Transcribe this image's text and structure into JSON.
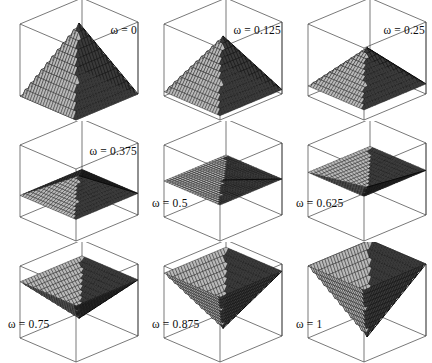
{
  "figure": {
    "type": "panel-grid",
    "rows": 3,
    "columns": 3,
    "background": "#ffffff",
    "line_color": "#3f3f3f",
    "mesh_line_color": "#111111",
    "face_light_color": "#b9b9b9",
    "face_dark_color": "#3a3a3a"
  },
  "chart_data": {
    "type": "line",
    "title": "",
    "subtitle": "",
    "xlabel": "",
    "ylabel": "",
    "zlabel": "",
    "grid": false,
    "legend_position": "none",
    "parameter_symbol": "ω",
    "parameter_values": [
      0,
      0.125,
      0.25,
      0.375,
      0.5,
      0.625,
      0.75,
      0.875,
      1
    ],
    "apex_height_fraction": [
      1,
      0.82,
      0.66,
      0.56,
      0.5,
      0.4,
      0.26,
      0.12,
      0.0
    ],
    "base_height_fraction": [
      0.0,
      0.06,
      0.14,
      0.3,
      0.5,
      0.62,
      0.78,
      0.9,
      1.0
    ],
    "axis_ranges": {
      "x": [
        0,
        1
      ],
      "y": [
        0,
        1
      ],
      "z": [
        0,
        1
      ]
    },
    "panels": [
      {
        "index": 0,
        "label": "ω = 0",
        "omega": 0,
        "label_position": "top-right",
        "apex": 1.0,
        "base": 0.0
      },
      {
        "index": 1,
        "label": "ω = 0.125",
        "omega": 0.125,
        "label_position": "top-right",
        "apex": 0.82,
        "base": 0.06
      },
      {
        "index": 2,
        "label": "ω = 0.25",
        "omega": 0.25,
        "label_position": "top-right",
        "apex": 0.66,
        "base": 0.14
      },
      {
        "index": 3,
        "label": "ω = 0.375",
        "omega": 0.375,
        "label_position": "top-right",
        "apex": 0.56,
        "base": 0.3
      },
      {
        "index": 4,
        "label": "ω = 0.5",
        "omega": 0.5,
        "label_position": "bottom-left",
        "apex": 0.5,
        "base": 0.5
      },
      {
        "index": 5,
        "label": "ω = 0.625",
        "omega": 0.625,
        "label_position": "bottom-left",
        "apex": 0.4,
        "base": 0.62
      },
      {
        "index": 6,
        "label": "ω = 0.75",
        "omega": 0.75,
        "label_position": "bottom-left",
        "apex": 0.26,
        "base": 0.78
      },
      {
        "index": 7,
        "label": "ω = 0.875",
        "omega": 0.875,
        "label_position": "bottom-left",
        "apex": 0.12,
        "base": 0.9
      },
      {
        "index": 8,
        "label": "ω = 1",
        "omega": 1,
        "label_position": "bottom-left",
        "apex": 0.0,
        "base": 1.0
      }
    ]
  }
}
